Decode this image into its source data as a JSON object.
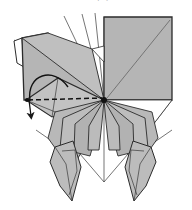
{
  "figure": {
    "caption_text": "of the top layer",
    "background_color": "#ffffff"
  },
  "palette": {
    "paper_front": "#b5b5b5",
    "paper_front_light": "#c4c4c4",
    "paper_front_dark": "#a8a8a8",
    "paper_back": "#ffffff",
    "outline": "#2b2b2b",
    "crease_line": "#555555",
    "fold_dashed": "#1a1a1a",
    "arrow_color": "#1a1a1a",
    "hinge_dot": "#111111"
  },
  "geometry": {
    "canvas_width": 192,
    "canvas_height": 210,
    "center_hinge": {
      "x": 104,
      "y": 100,
      "label": "center-convergence-point"
    },
    "left_pivot": {
      "x": 26,
      "y": 100,
      "label": "left-pivot-point"
    }
  },
  "shapes": {
    "big_square": {
      "name": "right-large-square-panel",
      "points": "104,17 172,17 172,100 104,100",
      "fill": "#b5b5b5",
      "diagonal": "108,98 170,20"
    },
    "square_lower_point": {
      "name": "right-lower-triangle",
      "points": "104,100 172,100 152,126",
      "fill": "#ffffff"
    },
    "upper_left_panel": {
      "name": "upper-left-large-panel",
      "points": "22,38 48,33 104,100 28,100",
      "fill": "#b5b5b5"
    },
    "upper_left_thin_flap": {
      "name": "upper-left-thin-flap",
      "points": "14,40 22,38 24,66 16,62",
      "fill": "#ffffff"
    },
    "upper_left_top_edge": {
      "name": "upper-left-top-band",
      "points": "22,38 48,33 92,47 104,100",
      "fill": "#bdbdbd"
    },
    "middle_kite": {
      "name": "center-left-kite-flap",
      "points": "26,100 58,78 104,100 52,116",
      "fill": "#c0c0c0"
    },
    "dashed_fold": {
      "name": "dashed-fold-line",
      "points": "26,100 104,100"
    }
  },
  "fan_flaps": {
    "name": "radiating-fan-flaps",
    "left": [
      {
        "name": "fan-flap-left-1",
        "points": "104,100 56,112 49,138 62,158 78,140"
      },
      {
        "name": "fan-flap-left-2",
        "points": "104,100 62,118 60,148 76,160 88,138"
      },
      {
        "name": "fan-flap-left-3",
        "points": "104,100 74,124 74,152 90,156 98,128"
      },
      {
        "name": "fan-flap-left-4",
        "points": "104,100 88,126 88,150 99,150 102,122"
      }
    ],
    "right": [
      {
        "name": "fan-flap-right-1",
        "points": "104,100 150,112 156,138 142,158 126,140"
      },
      {
        "name": "fan-flap-right-2",
        "points": "104,100 144,118 146,148 130,160 118,138"
      },
      {
        "name": "fan-flap-right-3",
        "points": "104,100 132,124 132,152 116,156 108,128"
      },
      {
        "name": "fan-flap-right-4",
        "points": "104,100 118,126 118,150 107,150 105,122"
      }
    ]
  },
  "legs": {
    "name": "bottom-leg-flaps",
    "left": {
      "name": "leg-left",
      "outer": "56,148 72,142 80,166 72,200 60,186 52,162",
      "inner": "62,152 74,150 76,170 68,194 62,176"
    },
    "right": {
      "name": "leg-right",
      "outer": "148,148 132,142 124,166 132,200 144,186 152,162",
      "inner": "142,152 130,150 128,170 136,194 142,176"
    }
  },
  "annotations": {
    "curved_arrow": {
      "name": "curved-fold-arrow",
      "description": "arc sweeping up and over to the left pivot",
      "path": "M 28,100 C 30,76 56,70 66,86"
    },
    "straight_arrow": {
      "name": "straight-pull-arrow",
      "description": "short arrow pointing down-left",
      "path": "M 30,100 L 30,120"
    },
    "thin_guides": {
      "name": "thin-construction-lines",
      "lines": [
        "104,100 104,182",
        "104,182 126,156",
        "104,182 80,156",
        "104,100 104,17",
        "104,100 66,16",
        "104,100 82,16",
        "104,100 96,14",
        "104,100 172,100",
        "104,100 152,126",
        "104,100 14,40",
        "26,100 22,38",
        "26,100 58,78",
        "26,100 52,116",
        "104,100 36,130",
        "104,100 172,130"
      ]
    }
  },
  "labels": {
    "center_point": "center hinge",
    "left_point": "left pivot"
  }
}
